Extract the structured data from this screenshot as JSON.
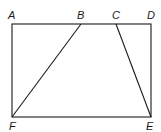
{
  "diagram": {
    "type": "geometry",
    "stroke_color": "#1a1a1a",
    "points": {
      "A": {
        "label": "A",
        "x": 12,
        "y": 24
      },
      "B": {
        "label": "B",
        "x": 81,
        "y": 24
      },
      "C": {
        "label": "C",
        "x": 116,
        "y": 24
      },
      "D": {
        "label": "D",
        "x": 151,
        "y": 24
      },
      "E": {
        "label": "E",
        "x": 151,
        "y": 117
      },
      "F": {
        "label": "F",
        "x": 12,
        "y": 117
      }
    },
    "segments": [
      {
        "from": "A",
        "to": "D"
      },
      {
        "from": "D",
        "to": "E"
      },
      {
        "from": "E",
        "to": "F"
      },
      {
        "from": "F",
        "to": "A"
      },
      {
        "from": "B",
        "to": "F"
      },
      {
        "from": "C",
        "to": "E"
      }
    ]
  }
}
